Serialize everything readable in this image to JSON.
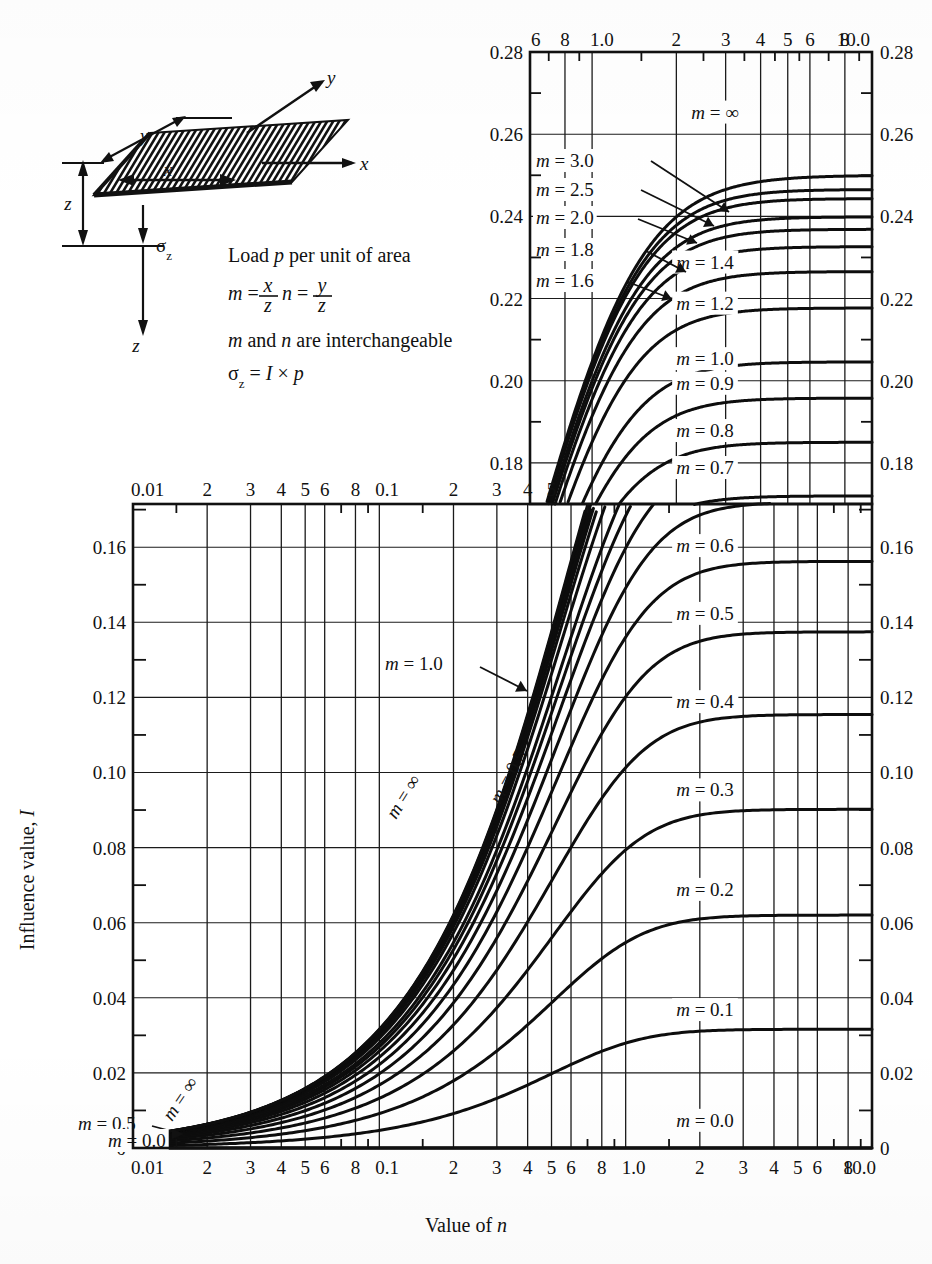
{
  "figure": {
    "xlabel": "Value of n",
    "ylabel": "Influence value, I"
  },
  "legend": {
    "line1": "Load p per unit of area",
    "formula_m": "m =",
    "formula_m_num1": "x",
    "formula_m_den1": "z",
    "formula_n": "n =",
    "formula_n_num": "y",
    "formula_n_den": "z",
    "line3": "m and n are interchangeable",
    "line4_sigma": "σ",
    "line4_sub": "z",
    "line4_rest": "= I × p",
    "axis_x": "x",
    "axis_y": "y",
    "axis_z": "z",
    "dim_x": "x",
    "dim_y": "y",
    "dim_z": "z",
    "sigma_label": "σ",
    "sigma_sub": "z"
  },
  "upper_chart": {
    "x_ticks_top": [
      "6",
      "8",
      "1.0",
      "2",
      "3",
      "4",
      "5",
      "6",
      "8",
      "10.0"
    ],
    "y_ticks_left": [
      "0.28",
      "0.26",
      "0.24",
      "0.22",
      "0.20",
      "0.18"
    ],
    "y_ticks_right": [
      "0.28",
      "0.26",
      "0.24",
      "0.22",
      "0.20",
      "0.18"
    ],
    "curve_labels": [
      "m = 3.0",
      "m = 2.5",
      "m = 2.0",
      "m = 1.8",
      "m = 1.6",
      "m = ∞",
      "m = 1.4",
      "m = 1.2",
      "m = 1.0",
      "m = 0.9",
      "m = 0.8",
      "m = 0.7",
      "m = 0.6",
      "m = 0.5",
      "m = 0.4",
      "m = 0.3",
      "m = 0.2",
      "m = 0.1",
      "m = 0.0"
    ]
  },
  "lower_chart": {
    "x_ticks_top": [
      "0.01",
      "2",
      "3",
      "4",
      "5",
      "6",
      "8",
      "0.1",
      "2",
      "3",
      "4",
      "5"
    ],
    "x_ticks_bottom": [
      "0.01",
      "2",
      "3",
      "4",
      "5",
      "6",
      "8",
      "0.1",
      "2",
      "3",
      "4",
      "5",
      "6",
      "8",
      "1.0",
      "2",
      "3",
      "4",
      "5",
      "6",
      "8",
      "10.0"
    ],
    "y_ticks_left": [
      "0.16",
      "0.14",
      "0.12",
      "0.10",
      "0.08",
      "0.06",
      "0.04",
      "0.02",
      "0"
    ],
    "y_ticks_right": [
      "0.16",
      "0.14",
      "0.12",
      "0.10",
      "0.08",
      "0.06",
      "0.04",
      "0.02",
      "0"
    ],
    "curve_labels": [
      "m = 1.0",
      "m = 0.5",
      "m = ∞",
      "m = 0.0"
    ]
  },
  "chart_data": {
    "type": "line",
    "xlabel": "Value of n",
    "ylabel": "Influence value, I",
    "xscale": "log",
    "panels": [
      {
        "name": "upper",
        "xlim": [
          0.6,
          10.0
        ],
        "ylim": [
          0.17,
          0.28
        ],
        "grid": true,
        "x_major_ticks": [
          0.6,
          0.8,
          1.0,
          2,
          3,
          4,
          5,
          6,
          8,
          10
        ],
        "y_major_ticks": [
          0.18,
          0.2,
          0.22,
          0.24,
          0.26,
          0.28
        ]
      },
      {
        "name": "lower",
        "xlim": [
          0.01,
          10.0
        ],
        "ylim": [
          0.0,
          0.172
        ],
        "grid": true,
        "x_major_ticks": [
          0.01,
          0.02,
          0.03,
          0.04,
          0.05,
          0.06,
          0.08,
          0.1,
          0.2,
          0.3,
          0.4,
          0.5,
          0.6,
          0.8,
          1.0,
          2,
          3,
          4,
          5,
          6,
          8,
          10
        ],
        "y_major_ticks": [
          0,
          0.02,
          0.04,
          0.06,
          0.08,
          0.1,
          0.12,
          0.14,
          0.16
        ]
      }
    ],
    "series_m_values": [
      0.0,
      0.1,
      0.2,
      0.3,
      0.4,
      0.5,
      0.6,
      0.7,
      0.8,
      0.9,
      1.0,
      1.2,
      1.4,
      1.6,
      1.8,
      2.0,
      2.5,
      3.0,
      99999
    ],
    "series": [
      {
        "name": "m = 0.0",
        "m": 0.0,
        "asymptote_I": 0.0
      },
      {
        "name": "m = 0.1",
        "m": 0.1,
        "asymptote_I": 0.0328
      },
      {
        "name": "m = 0.2",
        "m": 0.2,
        "asymptote_I": 0.0629
      },
      {
        "name": "m = 0.3",
        "m": 0.3,
        "asymptote_I": 0.0897
      },
      {
        "name": "m = 0.4",
        "m": 0.4,
        "asymptote_I": 0.1123
      },
      {
        "name": "m = 0.5",
        "m": 0.5,
        "asymptote_I": 0.135
      },
      {
        "name": "m = 0.6",
        "m": 0.6,
        "asymptote_I": 0.1529
      },
      {
        "name": "m = 0.7",
        "m": 0.7,
        "asymptote_I": 0.1684
      },
      {
        "name": "m = 0.8",
        "m": 0.8,
        "asymptote_I": 0.1798
      },
      {
        "name": "m = 0.9",
        "m": 0.9,
        "asymptote_I": 0.1907
      },
      {
        "name": "m = 1.0",
        "m": 1.0,
        "asymptote_I": 0.2
      },
      {
        "name": "m = 1.2",
        "m": 1.2,
        "asymptote_I": 0.2136
      },
      {
        "name": "m = 1.4",
        "m": 1.4,
        "asymptote_I": 0.2237
      },
      {
        "name": "m = 1.6",
        "m": 1.6,
        "asymptote_I": 0.2294
      },
      {
        "name": "m = 1.8",
        "m": 1.8,
        "asymptote_I": 0.234
      },
      {
        "name": "m = 2.0",
        "m": 2.0,
        "asymptote_I": 0.24
      },
      {
        "name": "m = 2.5",
        "m": 2.5,
        "asymptote_I": 0.2455
      },
      {
        "name": "m = 3.0",
        "m": 3.0,
        "asymptote_I": 0.2479
      },
      {
        "name": "m = ∞",
        "m": 99999,
        "asymptote_I": 0.25
      }
    ]
  }
}
